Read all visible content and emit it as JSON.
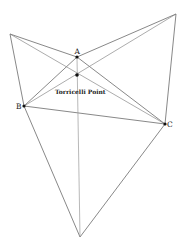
{
  "diagram": {
    "points": {
      "A": {
        "label": "A",
        "x": 77,
        "y": 57
      },
      "B": {
        "label": "B",
        "x": 24,
        "y": 106
      },
      "C": {
        "label": "C",
        "x": 165,
        "y": 124
      },
      "T": {
        "label": "Torricelli Point",
        "x": 77,
        "y": 75
      }
    },
    "outer_vertices": {
      "left": {
        "x": 10,
        "y": 34
      },
      "top_right": {
        "x": 176,
        "y": 14
      },
      "bottom": {
        "x": 80,
        "y": 237
      }
    },
    "line_color": "#555555",
    "point_color": "#111111"
  }
}
